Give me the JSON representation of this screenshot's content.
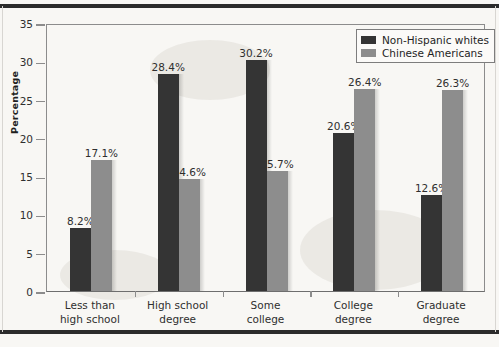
{
  "chart_data": {
    "type": "bar",
    "title": "",
    "xlabel": "",
    "ylabel": "Percentage",
    "ylim": [
      0,
      35
    ],
    "yticks": [
      0,
      5,
      10,
      15,
      20,
      25,
      30,
      35
    ],
    "grid": false,
    "legend_position": "top-right",
    "categories": [
      "Less than\nhigh school",
      "High school\ndegree",
      "Some\ncollege",
      "College\ndegree",
      "Graduate\ndegree"
    ],
    "category_lines": [
      [
        "Less than",
        "high school"
      ],
      [
        "High school",
        "degree"
      ],
      [
        "Some",
        "college"
      ],
      [
        "College",
        "degree"
      ],
      [
        "Graduate",
        "degree"
      ]
    ],
    "series": [
      {
        "name": "Non-Hispanic whites",
        "color": "#343434",
        "values": [
          8.2,
          28.4,
          30.2,
          20.6,
          12.6
        ],
        "labels": [
          "8.2%",
          "28.4%",
          "30.2%",
          "20.6%",
          "12.6%"
        ]
      },
      {
        "name": "Chinese Americans",
        "color": "#8d8d8d",
        "values": [
          17.1,
          14.6,
          15.7,
          26.4,
          26.3
        ],
        "labels": [
          "17.1%",
          "14.6%",
          "15.7%",
          "26.4%",
          "26.3%"
        ]
      }
    ]
  },
  "axis": {
    "y_tick_labels": [
      "0",
      "5",
      "10",
      "15",
      "20",
      "25",
      "30",
      "35"
    ],
    "y_title": "Percentage"
  },
  "legend": {
    "entries": [
      {
        "label": "Non-Hispanic whites",
        "color": "#343434"
      },
      {
        "label": "Chinese Americans",
        "color": "#8d8d8d"
      }
    ]
  }
}
